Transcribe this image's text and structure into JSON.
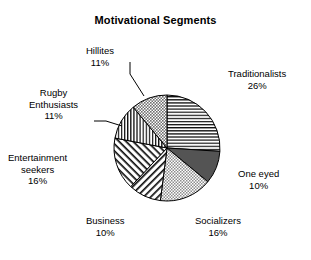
{
  "chart_data": {
    "type": "pie",
    "title": "Motivational Segments",
    "xlabel": "",
    "ylabel": "",
    "legend": "none",
    "grid": false,
    "labels_show_percent": true,
    "start_angle_deg": 0,
    "direction": "clockwise",
    "categories": [
      "Traditionalists",
      "One eyed",
      "Socializers",
      "Business",
      "Entertainment seekers",
      "Rugby Enthusiasts",
      "Hillites"
    ],
    "values": [
      26,
      10,
      16,
      10,
      16,
      11,
      11
    ],
    "value_unit": "%",
    "slices": [
      {
        "label": "Traditionalists",
        "value": 26,
        "percent_text": "26%",
        "pattern": "horizontal-lines",
        "fill": "#ffffff",
        "stroke": "#000000"
      },
      {
        "label": "One eyed",
        "value": 10,
        "percent_text": "10%",
        "pattern": "solid-dark-gray",
        "fill": "#545454",
        "stroke": "#000000"
      },
      {
        "label": "Socializers",
        "value": 16,
        "percent_text": "16%",
        "pattern": "fine-stipple",
        "fill": "#ffffff",
        "stroke": "#000000"
      },
      {
        "label": "Business",
        "value": 10,
        "percent_text": "10%",
        "pattern": "diagonal-lines-up",
        "fill": "#ffffff",
        "stroke": "#000000"
      },
      {
        "label": "Entertainment seekers",
        "value": 16,
        "percent_text": "16%",
        "pattern": "diagonal-lines-down",
        "fill": "#ffffff",
        "stroke": "#000000"
      },
      {
        "label": "Rugby Enthusiasts",
        "value": 11,
        "percent_text": "11%",
        "pattern": "vertical-lines",
        "fill": "#ffffff",
        "stroke": "#000000"
      },
      {
        "label": "Hillites",
        "value": 11,
        "percent_text": "11%",
        "pattern": "medium-stipple",
        "fill": "#ffffff",
        "stroke": "#000000"
      }
    ]
  },
  "labels": {
    "traditionalists": {
      "name": "Traditionalists",
      "pct": "26%"
    },
    "one_eyed": {
      "name": "One eyed",
      "pct": "10%"
    },
    "socializers": {
      "name": "Socializers",
      "pct": "16%"
    },
    "business": {
      "name": "Business",
      "pct": "10%"
    },
    "entertainment_line1": "Entertainment",
    "entertainment_line2": "seekers",
    "entertainment_pct": "16%",
    "rugby_line1": "Rugby",
    "rugby_line2": "Enthusiasts",
    "rugby_pct": "11%",
    "hillites": {
      "name": "Hillites",
      "pct": "11%"
    }
  },
  "colors": {
    "background": "#ffffff",
    "ink": "#000000",
    "dark_slice": "#545454"
  }
}
